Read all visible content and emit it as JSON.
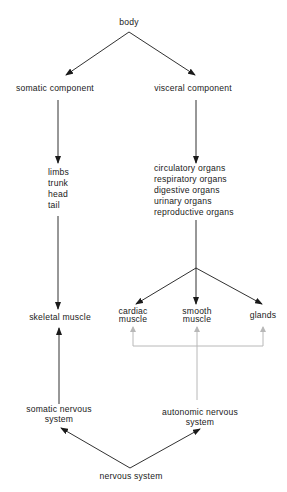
{
  "diagram": {
    "top": {
      "label": "body"
    },
    "left_branch": {
      "component": "somatic component",
      "parts": [
        "limbs",
        "trunk",
        "head",
        "tail"
      ],
      "target": "skeletal muscle",
      "system_line1": "somatic nervous",
      "system_line2": "system"
    },
    "right_branch": {
      "component": "visceral component",
      "organs": [
        "circulatory organs",
        "respiratory organs",
        "digestive organs",
        "urinary organs",
        "reproductive organs"
      ],
      "effectors": [
        {
          "line1": "cardiac",
          "line2": "muscle"
        },
        {
          "line1": "smooth",
          "line2": "muscle"
        },
        {
          "line1": "glands",
          "line2": ""
        }
      ],
      "system_line1": "autonomic nervous",
      "system_line2": "system"
    },
    "bottom": {
      "label": "nervous system"
    },
    "colors": {
      "arrow": "#1a1a1a",
      "autonomic_link": "#b8b8b8"
    }
  }
}
